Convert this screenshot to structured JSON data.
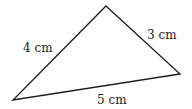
{
  "diagram": {
    "type": "triangle",
    "vertices": {
      "top": [
        106,
        6
      ],
      "right": [
        180,
        74
      ],
      "left": [
        13,
        100
      ]
    },
    "sides": [
      {
        "id": "left",
        "label": "4 cm",
        "length": 4,
        "from": "left",
        "to": "top"
      },
      {
        "id": "right",
        "label": "3 cm",
        "length": 3,
        "from": "top",
        "to": "right"
      },
      {
        "id": "bottom",
        "label": "5 cm",
        "length": 5,
        "from": "left",
        "to": "right"
      }
    ],
    "stroke_color": "#1a1a1a",
    "text_color": "#222222"
  }
}
